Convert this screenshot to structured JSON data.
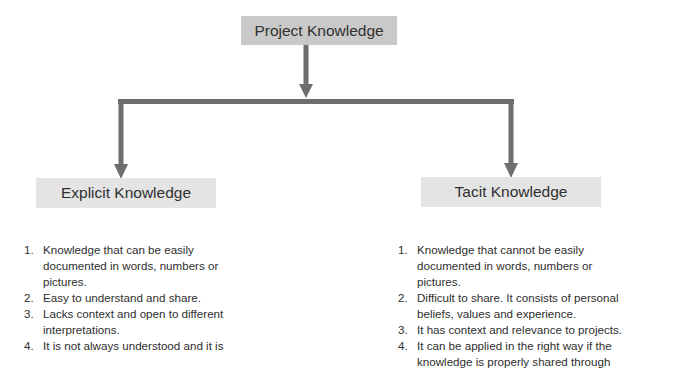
{
  "diagram": {
    "root": {
      "label": "Project Knowledge"
    },
    "children": [
      {
        "label": "Explicit Knowledge",
        "items": [
          {
            "num": "1.",
            "text": "Knowledge that can be easily documented in words, numbers or pictures."
          },
          {
            "num": "2.",
            "text": "Easy to understand and share."
          },
          {
            "num": "3.",
            "text": "Lacks context and open to different interpretations."
          },
          {
            "num": "4.",
            "text": "It is not always understood and it is"
          }
        ]
      },
      {
        "label": "Tacit Knowledge",
        "items": [
          {
            "num": "1.",
            "text": "Knowledge that cannot be easily documented in words, numbers or pictures."
          },
          {
            "num": "2.",
            "text": "Difficult to share. It consists of personal beliefs, values and experience."
          },
          {
            "num": "3.",
            "text": "It has context and relevance to projects."
          },
          {
            "num": "4.",
            "text": "It can be applied in the right way if the knowledge is properly shared through"
          }
        ]
      }
    ],
    "colors": {
      "root_box": "#c9c9c9",
      "child_box": "#e4e4e4",
      "connector": "#6e6e6e"
    }
  }
}
